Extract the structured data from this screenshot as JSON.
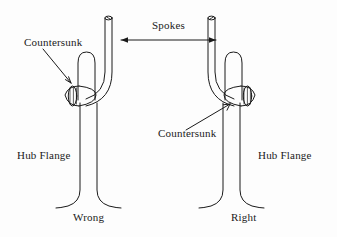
{
  "figure": {
    "type": "technical-line-diagram",
    "background_color": "#fdfdfd",
    "line_color": "#1a1a1a",
    "text_color": "#1a1a1a"
  },
  "labels": {
    "spokes": "Spokes",
    "countersunk_left": "Countersunk",
    "countersunk_right": "Countersunk",
    "hub_flange_left": "Hub Flange",
    "hub_flange_right": "Hub Flange",
    "caption_left": "Wrong",
    "caption_right": "Right"
  },
  "panels": [
    {
      "id": "left-panel",
      "caption": "Wrong",
      "hub_flange_label": "Hub Flange",
      "callout_label": "Countersunk",
      "countersunk_side": "left",
      "spoke_elbow_direction": "right"
    },
    {
      "id": "right-panel",
      "caption": "Right",
      "hub_flange_label": "Hub Flange",
      "callout_label": "Countersunk",
      "countersunk_side": "right",
      "spoke_elbow_direction": "left"
    }
  ],
  "annotations": {
    "spokes_arrow": "double-headed-arrow",
    "left_callout_arrow": "leader-arrow-down-right",
    "right_callout_arrow": "leader-arrow-up-right"
  }
}
